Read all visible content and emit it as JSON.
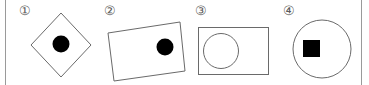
{
  "options": [
    {
      "label": "①",
      "description": "Diamond (square rotated 45°) containing a filled black circle"
    },
    {
      "label": "②",
      "description": "Tilted rectangle containing a filled black circle on its right side"
    },
    {
      "label": "③",
      "description": "Rectangle containing an unfilled circle on its left side"
    },
    {
      "label": "④",
      "description": "Circle containing a filled black square"
    }
  ],
  "colors": {
    "outline": "#6a6a6a",
    "fill": "#000000",
    "label": "#5a5a5a",
    "border": "#9a9a9a"
  }
}
